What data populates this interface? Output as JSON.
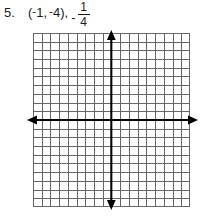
{
  "problem": {
    "number_label": "5.",
    "open_paren": "(",
    "x_negative_sign": "-",
    "x_value": "1",
    "separator": ", ",
    "y_negative_sign": "-",
    "y_value": "4",
    "close_paren": ")",
    "after_point_comma": ",",
    "fraction_minus": "-",
    "fraction_numerator": "1",
    "fraction_denominator": "4",
    "full_text": "5. (-1, -4), -1/4"
  },
  "graph": {
    "type": "cartesian-coordinate-plane",
    "columns": 18,
    "rows": 20,
    "cell_size_px": 8.7,
    "origin_cell_from_left": 9,
    "origin_cell_from_top": 10,
    "x_axis_label": "",
    "y_axis_label": "",
    "has_tick_numbers": false,
    "grid_line_color": "#666666",
    "axis_color": "#000000",
    "background_color": "#ffffff",
    "x_axis_arrows": "both",
    "y_axis_arrows": "both",
    "plotted_points": [],
    "plotted_lines": []
  }
}
